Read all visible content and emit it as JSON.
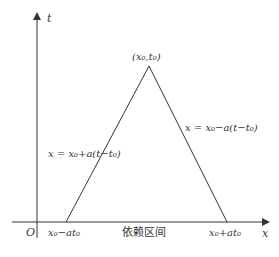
{
  "diagram": {
    "title": "依赖区间",
    "axes": {
      "x_label": "x",
      "y_label": "t",
      "origin_label": "O"
    },
    "apex_label": "(x₀,t₀)",
    "left_line_label": "x = x₀+a(t−t₀)",
    "right_line_label": "x = x₀−a(t−t₀)",
    "left_endpoint_label": "x₀−at₀",
    "right_endpoint_label": "x₀+at₀",
    "interval_label": "依赖区间",
    "colors": {
      "line": "#333333",
      "background": "#ffffff"
    }
  }
}
